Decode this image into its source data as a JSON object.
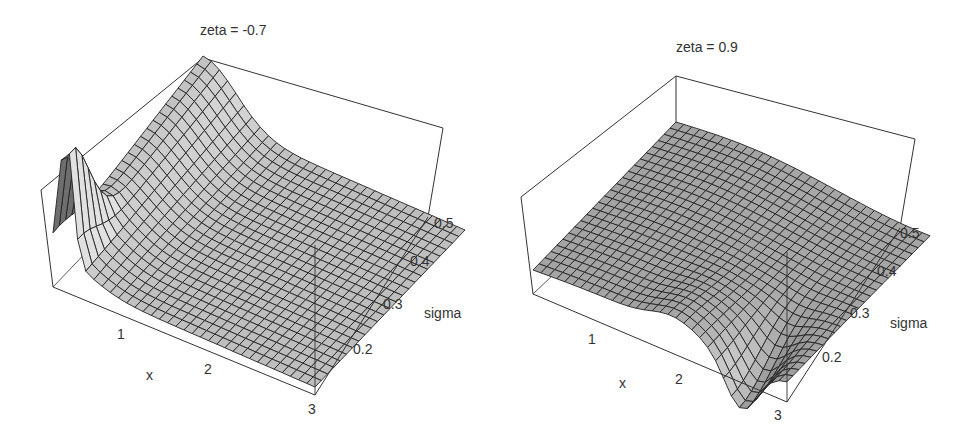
{
  "chart_data": [
    {
      "type": "surface3d",
      "title": "zeta = -0.7",
      "xlabel": "x",
      "ylabel": "sigma",
      "zlabel": "",
      "x_ticks": [
        "1",
        "2",
        "3"
      ],
      "y_ticks": [
        "0.2",
        "0.3",
        "0.4",
        "0.5"
      ],
      "x_range": [
        0.5,
        3
      ],
      "y_range": [
        0.15,
        0.5
      ],
      "description": "Mesh surface with a tall narrow spike near x≈0.6 at low sigma, a ridge along low x that decays rapidly with x, and a nearly flat plane for x>1.5",
      "grid": {
        "nx": 30,
        "ny": 24
      }
    },
    {
      "type": "surface3d",
      "title": "zeta = 0.9",
      "xlabel": "x",
      "ylabel": "sigma",
      "zlabel": "",
      "x_ticks": [
        "1",
        "2",
        "3"
      ],
      "y_ticks": [
        "0.2",
        "0.3",
        "0.4",
        "0.5"
      ],
      "x_range": [
        0.5,
        3
      ],
      "y_range": [
        0.15,
        0.5
      ],
      "description": "Mostly flat gently undulating mesh with a deep V-shaped trough near x≈2.5 at low sigma, flattening out as sigma increases",
      "grid": {
        "nx": 30,
        "ny": 24
      }
    }
  ],
  "panels": [
    {
      "title": "zeta = -0.7",
      "x_axis_label": "x",
      "y_axis_label": "sigma",
      "x_ticks": [
        {
          "label": "1"
        },
        {
          "label": "2"
        },
        {
          "label": "3"
        }
      ],
      "y_ticks": [
        {
          "label": "0.2"
        },
        {
          "label": "0.3"
        },
        {
          "label": "0.4"
        },
        {
          "label": "0.5"
        }
      ]
    },
    {
      "title": "zeta = 0.9",
      "x_axis_label": "x",
      "y_axis_label": "sigma",
      "x_ticks": [
        {
          "label": "1"
        },
        {
          "label": "2"
        },
        {
          "label": "3"
        }
      ],
      "y_ticks": [
        {
          "label": "0.2"
        },
        {
          "label": "0.3"
        },
        {
          "label": "0.4"
        },
        {
          "label": "0.5"
        }
      ]
    }
  ]
}
